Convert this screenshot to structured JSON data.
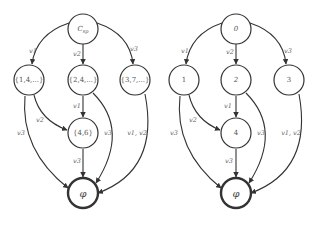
{
  "diagrams": [
    {
      "id": "left",
      "nodes": [
        {
          "key": "root",
          "label": "C_sp",
          "main": "C",
          "sub": "sp"
        },
        {
          "key": "n1",
          "label": "{1,4,...}"
        },
        {
          "key": "n2",
          "label": "{2,4,...}"
        },
        {
          "key": "n3",
          "label": "{3,7,...}"
        },
        {
          "key": "n4",
          "label": "{4,6}"
        },
        {
          "key": "sink",
          "label": "φ"
        }
      ],
      "edges": [
        {
          "from": "root",
          "to": "n1",
          "label": "v1"
        },
        {
          "from": "root",
          "to": "n2",
          "label": "v2"
        },
        {
          "from": "root",
          "to": "n3",
          "label": "v3"
        },
        {
          "from": "n2",
          "to": "n4",
          "label": "v1"
        },
        {
          "from": "n1",
          "to": "n4",
          "label": "v2"
        },
        {
          "from": "n1",
          "to": "sink",
          "label": "v3"
        },
        {
          "from": "n2",
          "to": "sink",
          "label": "v3"
        },
        {
          "from": "n4",
          "to": "sink",
          "label": "v3"
        },
        {
          "from": "n3",
          "to": "sink",
          "label": "v1, v2"
        }
      ]
    },
    {
      "id": "right",
      "nodes": [
        {
          "key": "root",
          "label": "0"
        },
        {
          "key": "n1",
          "label": "1"
        },
        {
          "key": "n2",
          "label": "2"
        },
        {
          "key": "n3",
          "label": "3"
        },
        {
          "key": "n4",
          "label": "4"
        },
        {
          "key": "sink",
          "label": "φ"
        }
      ],
      "edges": [
        {
          "from": "root",
          "to": "n1",
          "label": "v1"
        },
        {
          "from": "root",
          "to": "n2",
          "label": "v2"
        },
        {
          "from": "root",
          "to": "n3",
          "label": "v3"
        },
        {
          "from": "n2",
          "to": "n4",
          "label": "v1"
        },
        {
          "from": "n1",
          "to": "n4",
          "label": "v2"
        },
        {
          "from": "n1",
          "to": "sink",
          "label": "v3"
        },
        {
          "from": "n2",
          "to": "sink",
          "label": "v3"
        },
        {
          "from": "n4",
          "to": "sink",
          "label": "v3"
        },
        {
          "from": "n3",
          "to": "sink",
          "label": "v1, v2"
        }
      ]
    }
  ],
  "colors": {
    "stroke": "#333333",
    "text": "#555555",
    "background": "#ffffff"
  }
}
